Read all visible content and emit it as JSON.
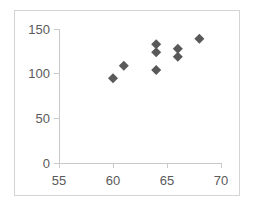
{
  "chart_data": {
    "type": "scatter",
    "title": "",
    "xlabel": "",
    "ylabel": "",
    "xlim": [
      55,
      70
    ],
    "ylim": [
      0,
      150
    ],
    "xticks": [
      55,
      60,
      65,
      70
    ],
    "yticks": [
      0,
      50,
      100,
      150
    ],
    "xtick_labels": [
      "55",
      "60",
      "65",
      "70"
    ],
    "ytick_labels": [
      "0",
      "50",
      "100",
      "150"
    ],
    "grid": false,
    "legend": false,
    "legend_position": "none",
    "marker_shape": "diamond",
    "marker_color": "#595959",
    "marker_size": 9,
    "axis_color": "#c9c9c9",
    "tick_label_color": "#5a5a5a",
    "border_color": "#d4d4d4",
    "background_color": "#ffffff",
    "series": [
      {
        "name": "Series 1",
        "points": [
          {
            "x": 60,
            "y": 95
          },
          {
            "x": 61,
            "y": 109
          },
          {
            "x": 64,
            "y": 104
          },
          {
            "x": 64,
            "y": 124
          },
          {
            "x": 64,
            "y": 133
          },
          {
            "x": 66,
            "y": 119
          },
          {
            "x": 66,
            "y": 128
          },
          {
            "x": 68,
            "y": 139
          }
        ]
      }
    ]
  }
}
